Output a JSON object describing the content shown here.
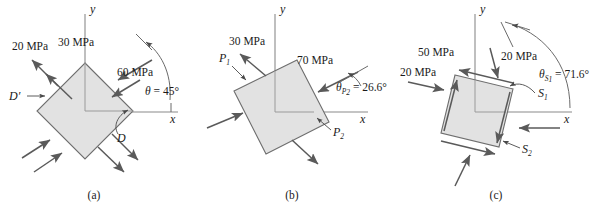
{
  "figure": {
    "background": "#ffffff",
    "element_fill": "#e2e2e2",
    "element_stroke": "#6e6e6e",
    "arrow_color": "#5a5a5a",
    "axis_color": "#8a8a8a"
  },
  "panels": [
    {
      "id": "a",
      "caption": "(a)",
      "axis_x": "x",
      "axis_y": "y",
      "origin": "O",
      "rotation_deg": 45,
      "stress_labels": [
        {
          "name": "sigma-20",
          "text": "20 MPa"
        },
        {
          "name": "sigma-30",
          "text": "30 MPa"
        },
        {
          "name": "sigma-60",
          "text": "60 MPa"
        }
      ],
      "plane_labels": [
        {
          "name": "plane-d-prime",
          "text": "D′"
        },
        {
          "name": "plane-d",
          "text": "D"
        }
      ],
      "angle": {
        "symbol": "θ",
        "subscript": "",
        "equals": "= 45°",
        "value": 45,
        "full": "θ = 45°"
      }
    },
    {
      "id": "b",
      "caption": "(b)",
      "axis_x": "x",
      "axis_y": "y",
      "origin": "O",
      "rotation_deg": 26.6,
      "stress_labels": [
        {
          "name": "sigma-30",
          "text": "30 MPa"
        },
        {
          "name": "sigma-70",
          "text": "70 MPa"
        }
      ],
      "plane_labels": [
        {
          "name": "plane-p1",
          "text": "P",
          "subscript": "1"
        },
        {
          "name": "plane-p2",
          "text": "P",
          "subscript": "2"
        }
      ],
      "angle": {
        "symbol": "θ",
        "subscript": "P2",
        "equals": "= 26.6°",
        "value": 26.6,
        "full": "θP2 = 26.6°"
      }
    },
    {
      "id": "c",
      "caption": "(c)",
      "axis_x": "x",
      "axis_y": "y",
      "origin": "O",
      "rotation_deg": 71.6,
      "stress_labels": [
        {
          "name": "sigma-50",
          "text": "50 MPa"
        },
        {
          "name": "sigma-20-top",
          "text": "20 MPa"
        },
        {
          "name": "sigma-20-left",
          "text": "20 MPa"
        }
      ],
      "plane_labels": [
        {
          "name": "plane-s1",
          "text": "S",
          "subscript": "1"
        },
        {
          "name": "plane-s2",
          "text": "S",
          "subscript": "2"
        }
      ],
      "angle": {
        "symbol": "θ",
        "subscript": "S1",
        "equals": "= 71.6°",
        "value": 71.6,
        "full": "θS1 = 71.6°"
      }
    }
  ]
}
